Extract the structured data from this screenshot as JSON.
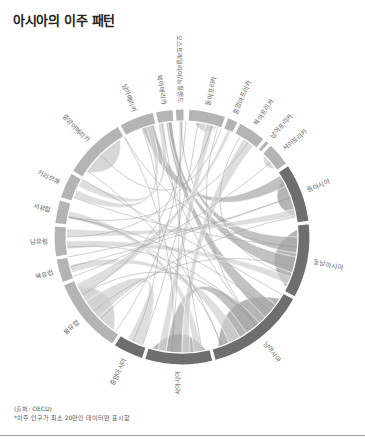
{
  "title": "아시아의 이주 패턴",
  "chart_data": {
    "type": "chord",
    "title": "아시아의 이주 패턴",
    "center": [
      182,
      237
    ],
    "outer_radius": 128,
    "inner_radius": 116,
    "colors": {
      "ring_light": "#b4b4b4",
      "ring_mid": "#8f8f8f",
      "ring_dark": "#6e6e6e",
      "chord_light": "#d0d0d0",
      "chord_mid": "#a8a8a8",
      "chord_dark": "#7e7e7e"
    },
    "segments": [
      {
        "name": "오스트레일리아/뉴질랜드",
        "start": 357,
        "end": 361,
        "tone": "light"
      },
      {
        "name": "동아프리카",
        "start": 363,
        "end": 380,
        "tone": "light"
      },
      {
        "name": "중앙아프리카",
        "start": 381,
        "end": 386,
        "tone": "light"
      },
      {
        "name": "북아프리카",
        "start": 387,
        "end": 400,
        "tone": "light"
      },
      {
        "name": "남아프리카",
        "start": 401,
        "end": 403,
        "tone": "light"
      },
      {
        "name": "서아프리카",
        "start": 404,
        "end": 415,
        "tone": "light"
      },
      {
        "name": "동아시아",
        "start": 416,
        "end": 443,
        "tone": "dark"
      },
      {
        "name": "동남아시아",
        "start": 444,
        "end": 478,
        "tone": "dark"
      },
      {
        "name": "남아시아",
        "start": 479,
        "end": 525,
        "tone": "dark"
      },
      {
        "name": "서아시아",
        "start": 526,
        "end": 557,
        "tone": "dark"
      },
      {
        "name": "중앙아시아",
        "start": 558,
        "end": 572,
        "tone": "dark"
      },
      {
        "name": "동유럽",
        "start": 573,
        "end": 608,
        "tone": "light"
      },
      {
        "name": "북유럽",
        "start": 609,
        "end": 620,
        "tone": "light"
      },
      {
        "name": "남유럽",
        "start": 621,
        "end": 635,
        "tone": "light"
      },
      {
        "name": "서유럽",
        "start": 636,
        "end": 647,
        "tone": "light"
      },
      {
        "name": "카리브해",
        "start": 648,
        "end": 660,
        "tone": "light"
      },
      {
        "name": "중앙아메리카",
        "start": 661,
        "end": 690,
        "tone": "light"
      },
      {
        "name": "남아메리카",
        "start": 691,
        "end": 707,
        "tone": "light"
      },
      {
        "name": "북아메리카",
        "start": 708,
        "end": 716,
        "tone": "light"
      }
    ],
    "chords": [
      {
        "from": [
          420,
          440
        ],
        "to": [
          420,
          440
        ],
        "tone": "mid",
        "self": true
      },
      {
        "from": [
          446,
          476
        ],
        "to": [
          446,
          476
        ],
        "tone": "mid",
        "self": true
      },
      {
        "from": [
          482,
          522
        ],
        "to": [
          482,
          522
        ],
        "tone": "mid",
        "self": true
      },
      {
        "from": [
          528,
          555
        ],
        "to": [
          528,
          555
        ],
        "tone": "mid",
        "self": true
      },
      {
        "from": [
          576,
          605
        ],
        "to": [
          576,
          605
        ],
        "tone": "light",
        "self": true
      },
      {
        "from": [
          664,
          688
        ],
        "to": [
          664,
          688
        ],
        "tone": "light",
        "self": true
      },
      {
        "from": [
          366,
          378
        ],
        "to": [
          366,
          378
        ],
        "tone": "light",
        "self": true
      },
      {
        "from": [
          405,
          414
        ],
        "to": [
          405,
          414
        ],
        "tone": "light",
        "self": true
      },
      {
        "from": [
          418,
          424
        ],
        "to": [
          700,
          706
        ],
        "tone": "mid"
      },
      {
        "from": [
          450,
          458
        ],
        "to": [
          359,
          360
        ],
        "tone": "mid"
      },
      {
        "from": [
          486,
          494
        ],
        "to": [
          712,
          715
        ],
        "tone": "mid"
      },
      {
        "from": [
          460,
          468
        ],
        "to": [
          713,
          715
        ],
        "tone": "mid"
      },
      {
        "from": [
          498,
          506
        ],
        "to": [
          540,
          548
        ],
        "tone": "mid"
      },
      {
        "from": [
          530,
          534
        ],
        "to": [
          639,
          643
        ],
        "tone": "light"
      },
      {
        "from": [
          560,
          568
        ],
        "to": [
          586,
          596
        ],
        "tone": "light"
      },
      {
        "from": [
          510,
          516
        ],
        "to": [
          612,
          616
        ],
        "tone": "light"
      },
      {
        "from": [
          470,
          474
        ],
        "to": [
          624,
          628
        ],
        "tone": "light"
      },
      {
        "from": [
          436,
          440
        ],
        "to": [
          630,
          634
        ],
        "tone": "light"
      },
      {
        "from": [
          548,
          552
        ],
        "to": [
          372,
          376
        ],
        "tone": "light"
      },
      {
        "from": [
          536,
          540
        ],
        "to": [
          392,
          398
        ],
        "tone": "light"
      },
      {
        "from": [
          600,
          606
        ],
        "to": [
          383,
          385
        ],
        "tone": "light"
      },
      {
        "from": [
          656,
          660
        ],
        "to": [
          708,
          711
        ],
        "tone": "light"
      },
      {
        "from": [
          650,
          654
        ],
        "to": [
          702,
          705
        ],
        "tone": "light"
      }
    ]
  },
  "footer": {
    "source": "(출처: OECD)",
    "note": "*이주 인구가 최소 20만인 데이터만 표시함"
  }
}
